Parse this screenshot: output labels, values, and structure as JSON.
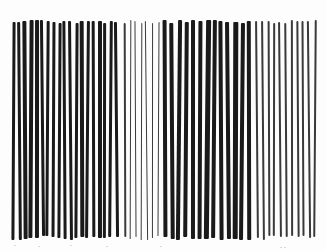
{
  "image": {
    "description": "Scanned black-and-white vertical line grating with alternating groups of thick and thin wavy vertical lines",
    "background_color": "#fdfdfd",
    "ink_color": "#1a1a1a",
    "thin_ink_color": "#3a3a3a",
    "top": 20,
    "bottom": 240
  },
  "groups": [
    {
      "name": "thick-left",
      "start_x": 12,
      "count": 19,
      "period": 5.7,
      "width": 3.4,
      "thin": false
    },
    {
      "name": "thin-middle-left",
      "start_x": 124,
      "count": 7,
      "period": 5.6,
      "width": 1.4,
      "thin": true
    },
    {
      "name": "thick-right",
      "start_x": 163,
      "count": 13,
      "period": 7.0,
      "width": 4.2,
      "thin": false
    },
    {
      "name": "thin-right",
      "start_x": 256,
      "count": 11,
      "period": 5.8,
      "width": 1.8,
      "thin": true
    }
  ],
  "specks": [
    {
      "x": 14,
      "y": 245
    },
    {
      "x": 38,
      "y": 246
    },
    {
      "x": 70,
      "y": 245
    },
    {
      "x": 106,
      "y": 246
    },
    {
      "x": 160,
      "y": 246
    },
    {
      "x": 280,
      "y": 247
    },
    {
      "x": 284,
      "y": 247
    }
  ]
}
